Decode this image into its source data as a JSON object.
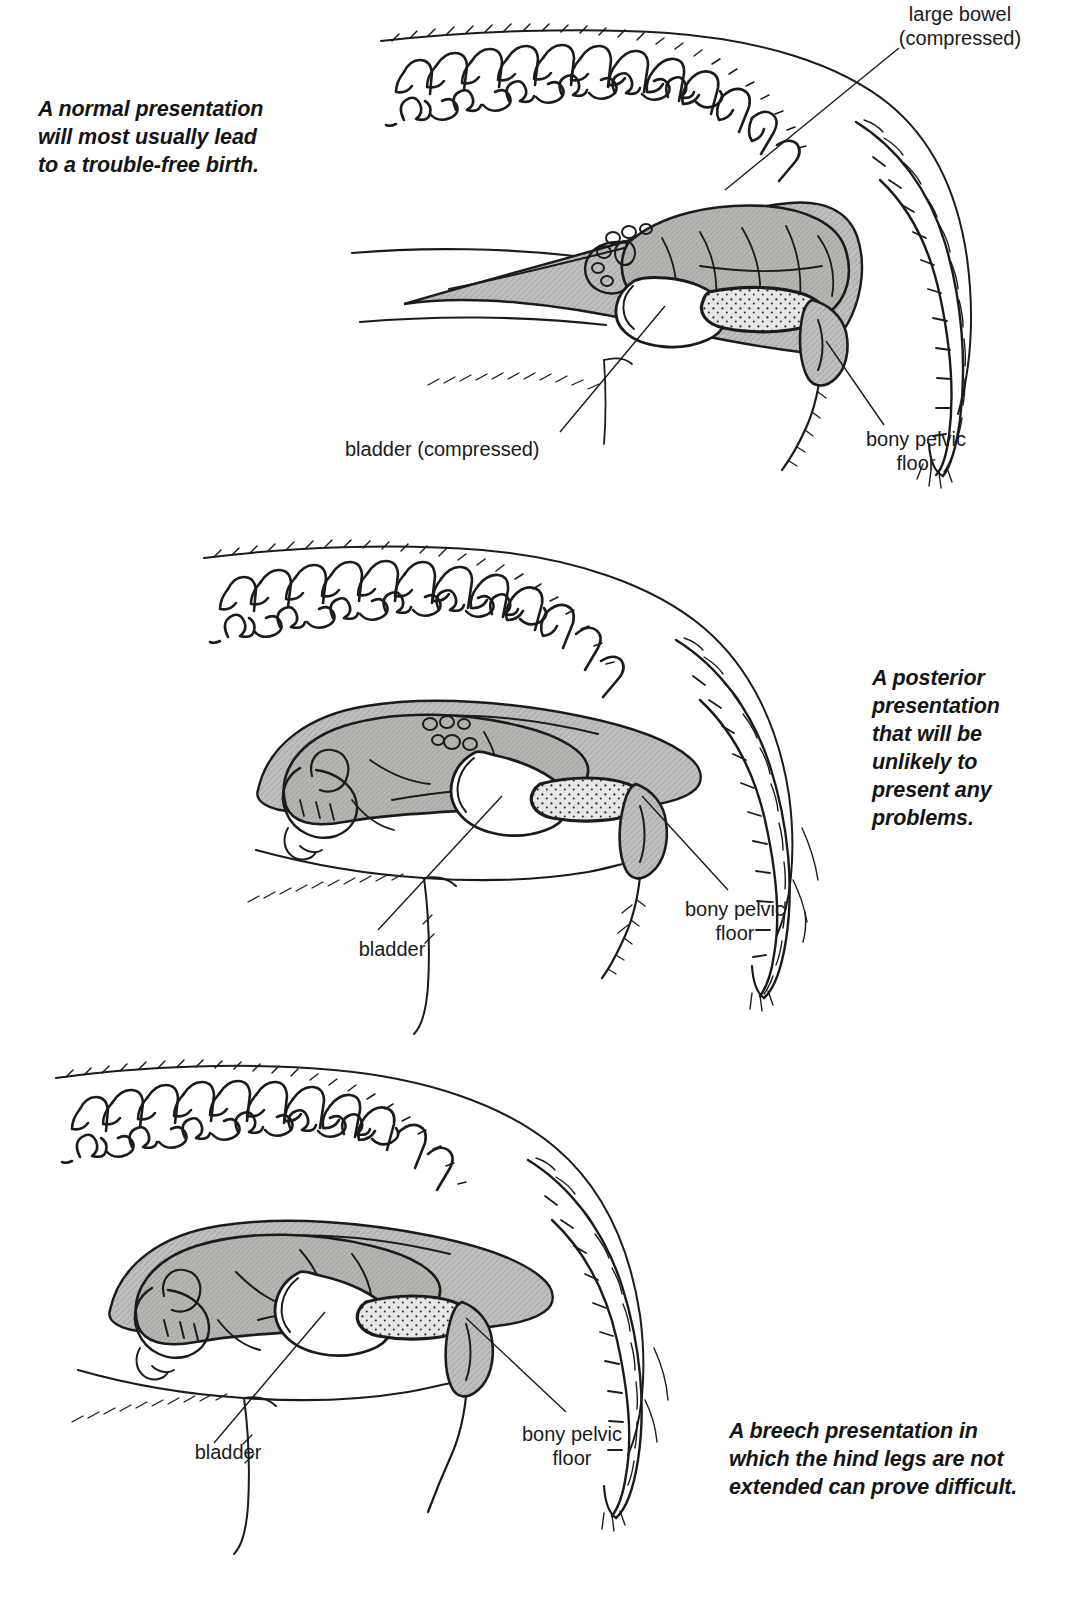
{
  "document": {
    "title": "Fetal presentations at birth",
    "type": "veterinary-obstetrics-line-diagram",
    "background_color": "#ffffff",
    "ink_color": "#1b1b1b",
    "shading_color": "#b4b2b0"
  },
  "panels": [
    {
      "id": "panel-normal",
      "caption": "A normal presentation\nwill most usually lead\nto a trouble-free birth.",
      "labels": [
        {
          "name": "large-bowel",
          "text": "large bowel\n(compressed)",
          "align": "center"
        },
        {
          "name": "bladder",
          "text": "bladder (compressed)",
          "align": "left"
        },
        {
          "name": "bony-pelvic-floor",
          "text": "bony pelvic\nfloor",
          "align": "center"
        }
      ]
    },
    {
      "id": "panel-posterior",
      "caption": "A posterior\npresentation\nthat will be\nunlikely to\npresent any\nproblems.",
      "labels": [
        {
          "name": "bladder",
          "text": "bladder",
          "align": "center"
        },
        {
          "name": "bony-pelvic-floor",
          "text": "bony pelvic\nfloor",
          "align": "center"
        }
      ]
    },
    {
      "id": "panel-breech",
      "caption": "A breech presentation in\nwhich the hind legs are not\nextended can prove difficult.",
      "labels": [
        {
          "name": "bladder",
          "text": "bladder",
          "align": "center"
        },
        {
          "name": "bony-pelvic-floor",
          "text": "bony pelvic\nfloor",
          "align": "center"
        }
      ]
    }
  ]
}
